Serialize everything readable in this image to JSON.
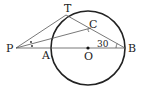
{
  "diagram": {
    "points": {
      "P": {
        "label": "P"
      },
      "A": {
        "label": "A"
      },
      "O": {
        "label": "O"
      },
      "B": {
        "label": "B"
      },
      "T": {
        "label": "T"
      },
      "C": {
        "label": "C"
      }
    },
    "angle_label": "30°",
    "angle_text": "30",
    "segments": [
      "P-B",
      "P-T",
      "P-C",
      "T-B"
    ],
    "circle": {
      "center": "O",
      "through": [
        "A",
        "B",
        "T"
      ]
    },
    "marks": {
      "bisector_dots": 2,
      "angle_arc_at": "B"
    }
  }
}
